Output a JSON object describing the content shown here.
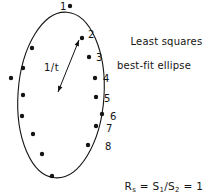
{
  "figure": {
    "background_color": "#ffffff",
    "ink_color": "#141414",
    "width": 204,
    "height": 193
  },
  "caption": {
    "line_1": "Least squares",
    "line_2": "best-fit ellipse"
  },
  "formula": {
    "lhs": "R",
    "lhs_sub": "s",
    "eq_1": " = S",
    "num_sub": "1",
    "slash": "/S",
    "den_sub": "2",
    "eq_2": " = 1.95",
    "full_text": "Rs = S1/S2 = 1.95",
    "value": 1.95
  },
  "thickness_annotation": {
    "label": "1/t"
  },
  "point_labels": [
    {
      "text": "1",
      "x": 60,
      "y": 2
    },
    {
      "text": "2",
      "x": 88,
      "y": 30
    },
    {
      "text": "3",
      "x": 96,
      "y": 53
    },
    {
      "text": "4",
      "x": 103,
      "y": 74
    },
    {
      "text": "5",
      "x": 104,
      "y": 94
    },
    {
      "text": "6",
      "x": 110,
      "y": 112
    },
    {
      "text": "7",
      "x": 106,
      "y": 124
    },
    {
      "text": "8",
      "x": 105,
      "y": 142
    }
  ],
  "chart_data": {
    "type": "scatter",
    "title": "Least squares best-fit ellipse",
    "xlabel": "",
    "ylabel": "",
    "grid": false,
    "legend": false,
    "ellipse": {
      "center_x": 61,
      "center_y": 95,
      "semi_major": 83,
      "semi_minor": 43,
      "rotation_deg": 4,
      "stroke_color": "#141414",
      "stroke_width": 1.1
    },
    "axis_arrow": {
      "label": "1/t",
      "x1": 58,
      "y1": 92,
      "x2": 79,
      "y2": 40,
      "double_headed": true
    },
    "marker_color": "#141414",
    "marker_radius": 2.2,
    "points": [
      {
        "x": 70,
        "y": 6,
        "label": "1"
      },
      {
        "x": 82,
        "y": 38,
        "label": "2"
      },
      {
        "x": 89,
        "y": 57,
        "label": "3"
      },
      {
        "x": 95,
        "y": 78,
        "label": "4"
      },
      {
        "x": 96,
        "y": 97,
        "label": "5"
      },
      {
        "x": 102,
        "y": 114,
        "label": "6"
      },
      {
        "x": 96,
        "y": 126,
        "label": "7"
      },
      {
        "x": 88,
        "y": 145,
        "label": "8"
      },
      {
        "x": 32,
        "y": 48,
        "label": ""
      },
      {
        "x": 23,
        "y": 68,
        "label": ""
      },
      {
        "x": 11,
        "y": 78,
        "label": ""
      },
      {
        "x": 23,
        "y": 95,
        "label": ""
      },
      {
        "x": 22,
        "y": 116,
        "label": ""
      },
      {
        "x": 33,
        "y": 134,
        "label": ""
      },
      {
        "x": 42,
        "y": 154,
        "label": ""
      },
      {
        "x": 52,
        "y": 176,
        "label": ""
      }
    ]
  }
}
